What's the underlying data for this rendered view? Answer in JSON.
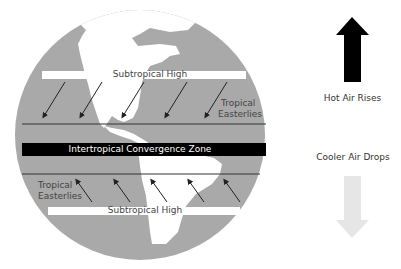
{
  "diagram": {
    "colors": {
      "background": "#ffffff",
      "ocean": "#a9a9a9",
      "land": "#ffffff",
      "itcz_band": "#000000",
      "line": "#222222",
      "hot_arrow": "#000000",
      "cool_arrow": "#e6e6e6"
    },
    "globe": {
      "upper_band_label": "Subtropical High",
      "upper_easterlies_label_line1": "Tropical",
      "upper_easterlies_label_line2": "Easterlies",
      "itcz_label": "Intertropical Convergence Zone",
      "lower_easterlies_label_line1": "Tropical",
      "lower_easterlies_label_line2": "Easterlies",
      "lower_band_label": "Subtropical High",
      "upper_arrow_count": 5,
      "lower_arrow_count": 5
    },
    "legend": {
      "hot_arrow_icon": "arrow-up-icon",
      "hot_label": "Hot Air Rises",
      "cool_label": "Cooler Air Drops",
      "cool_arrow_icon": "arrow-down-icon"
    }
  }
}
